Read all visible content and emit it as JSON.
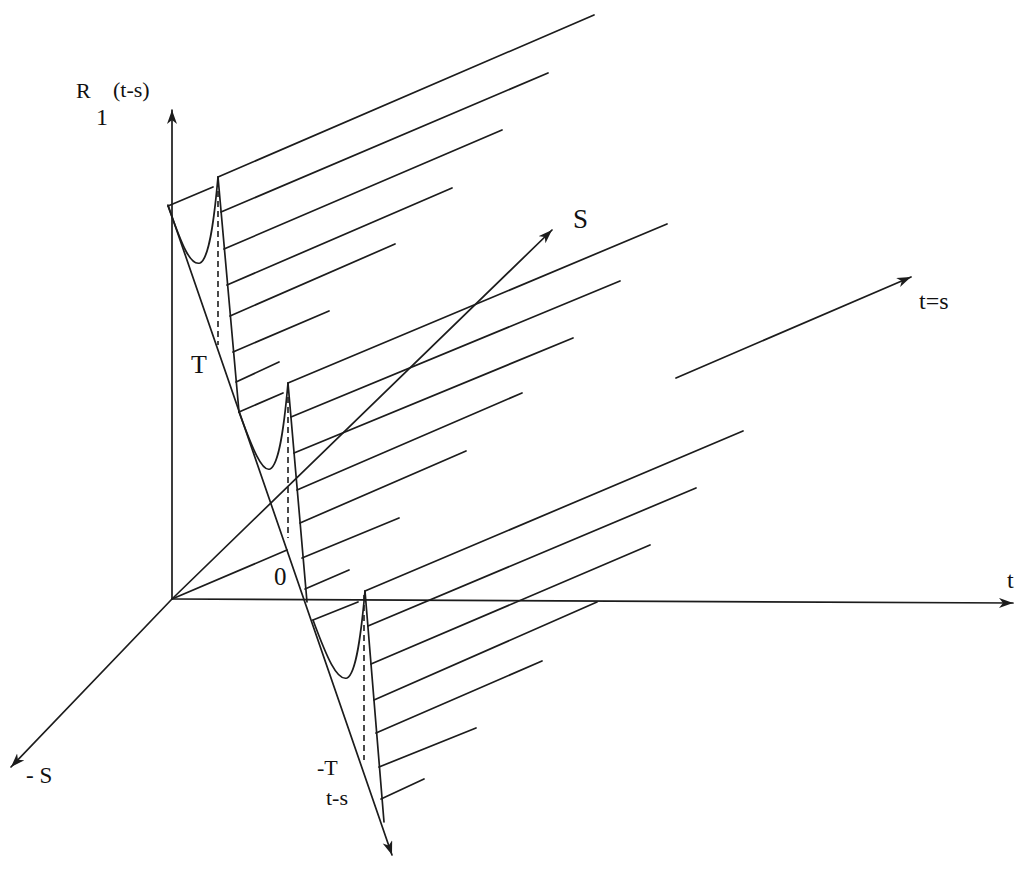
{
  "figure": {
    "kind": "3D sketch of a periodic covariance function over the (t, s) plane",
    "axes": {
      "vertical": {
        "label_main": "R",
        "label_sub": "1",
        "label_arg": "(t-s)"
      },
      "t_axis": {
        "label": "t"
      },
      "s_axis": {
        "label": "S"
      },
      "neg_s_axis": {
        "label": "- S"
      },
      "diagonal_axis": {
        "label": "t=s"
      },
      "lag_axis": {
        "label": "t-s"
      }
    },
    "lag_ticks": {
      "plus_period": "T",
      "zero": "0",
      "minus_period": "-T"
    },
    "periods_shown": 3,
    "hatch_lines_per_period": 7,
    "colors": {
      "ink": "#1c1c1c",
      "background": "#ffffff"
    }
  }
}
